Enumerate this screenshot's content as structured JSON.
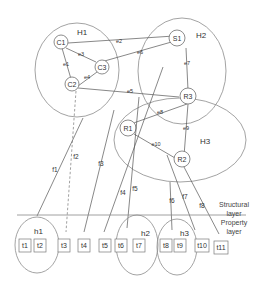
{
  "diagram": {
    "groups": [
      {
        "id": "H1",
        "label": "H1"
      },
      {
        "id": "H2",
        "label": "H2"
      },
      {
        "id": "H3",
        "label": "H3"
      },
      {
        "id": "h1",
        "label": "h1"
      },
      {
        "id": "h2",
        "label": "h2"
      },
      {
        "id": "h3",
        "label": "h3"
      }
    ],
    "nodes": [
      {
        "id": "C1",
        "label": "C1"
      },
      {
        "id": "C2",
        "label": "C2"
      },
      {
        "id": "C3",
        "label": "C3"
      },
      {
        "id": "S1",
        "label": "S1"
      },
      {
        "id": "R1",
        "label": "R1"
      },
      {
        "id": "R2",
        "label": "R2"
      },
      {
        "id": "R3",
        "label": "R3"
      }
    ],
    "edges": [
      {
        "id": "e1",
        "label": "e1",
        "from": "C1",
        "to": "C2"
      },
      {
        "id": "e2",
        "label": "e2",
        "from": "C1",
        "to": "S1"
      },
      {
        "id": "e3",
        "label": "e3",
        "from": "C1",
        "to": "C3"
      },
      {
        "id": "e4",
        "label": "e4",
        "from": "C3",
        "to": "C2"
      },
      {
        "id": "e5",
        "label": "e5",
        "from": "C2",
        "to": "R3"
      },
      {
        "id": "e6",
        "label": "e6",
        "from": "C3",
        "to": "S1"
      },
      {
        "id": "e7",
        "label": "e7",
        "from": "S1",
        "to": "R3"
      },
      {
        "id": "e8",
        "label": "e8",
        "from": "R1",
        "to": "R3"
      },
      {
        "id": "e9",
        "label": "e9",
        "from": "R3",
        "to": "R2"
      },
      {
        "id": "e10",
        "label": "e10",
        "from": "R1",
        "to": "R2"
      }
    ],
    "property_links": [
      {
        "id": "f1",
        "label": "f1",
        "from": "H1",
        "to": "h1",
        "style": "solid"
      },
      {
        "id": "f2",
        "label": "f2",
        "from": "C2",
        "to": "t3",
        "style": "dashed"
      },
      {
        "id": "f3",
        "label": "f3",
        "from": "H2",
        "to": "t4",
        "style": "solid"
      },
      {
        "id": "f4",
        "label": "f4",
        "from": "S1",
        "to": "t5",
        "style": "solid"
      },
      {
        "id": "f5",
        "label": "f5",
        "from": "H3",
        "to": "h2",
        "style": "solid"
      },
      {
        "id": "f6",
        "label": "f6",
        "from": "H3",
        "to": "h3",
        "style": "solid"
      },
      {
        "id": "f7",
        "label": "f7",
        "from": "e10",
        "to": "t10",
        "style": "solid"
      },
      {
        "id": "f8",
        "label": "f8",
        "from": "R2",
        "to": "t11",
        "style": "solid"
      }
    ],
    "properties": [
      {
        "id": "t1",
        "label": "t1"
      },
      {
        "id": "t2",
        "label": "t2"
      },
      {
        "id": "t3",
        "label": "t3"
      },
      {
        "id": "t4",
        "label": "t4"
      },
      {
        "id": "t5",
        "label": "t5"
      },
      {
        "id": "t6",
        "label": "t6"
      },
      {
        "id": "t7",
        "label": "t7"
      },
      {
        "id": "t8",
        "label": "t8"
      },
      {
        "id": "t9",
        "label": "t9"
      },
      {
        "id": "t10",
        "label": "t10"
      },
      {
        "id": "t11",
        "label": "t11"
      }
    ],
    "layers": {
      "structural": [
        "Structural",
        "layer"
      ],
      "property": [
        "Property",
        "layer"
      ]
    }
  }
}
